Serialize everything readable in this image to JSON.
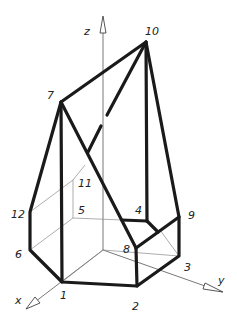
{
  "figure": {
    "type": "isometric solid drawing",
    "axes": {
      "z": "z",
      "x": "x",
      "y": "y"
    },
    "vertex_labels": [
      "1",
      "2",
      "3",
      "4",
      "5",
      "6",
      "7",
      "8",
      "9",
      "10",
      "11",
      "12"
    ]
  }
}
